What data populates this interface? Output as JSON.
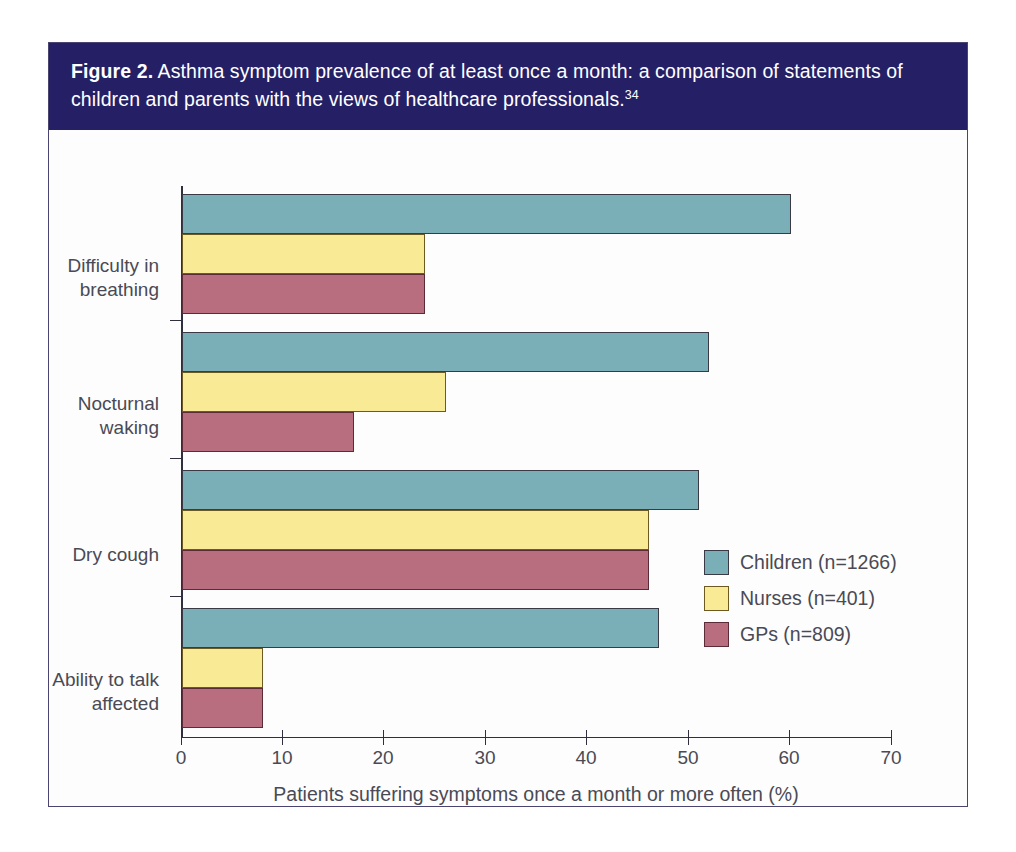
{
  "figure": {
    "label": "Figure 2.",
    "caption": " Asthma symptom prevalence of at least once a month: a comparison of statements of children and parents with the views of healthcare professionals.",
    "reference": "34",
    "header_color": "#251f66",
    "frame_color": "#4a4470"
  },
  "chart_data": {
    "type": "bar",
    "orientation": "horizontal",
    "title": "Asthma symptom prevalence of at least once a month: a comparison of statements of children and parents with the views of healthcare professionals.",
    "xlabel": "Patients suffering symptoms once a month or more often (%)",
    "ylabel": "",
    "categories": [
      "Difficulty in breathing",
      "Nocturnal waking",
      "Dry cough",
      "Ability to talk affected"
    ],
    "series": [
      {
        "name": "Children (n=1266)",
        "color": "#7bafb8",
        "values": [
          60,
          52,
          51,
          47
        ]
      },
      {
        "name": "Nurses (n=401)",
        "color": "#f9eb95",
        "values": [
          24,
          26,
          46,
          8
        ]
      },
      {
        "name": "GPs (n=809)",
        "color": "#b96e80",
        "values": [
          24,
          17,
          46,
          8
        ]
      }
    ],
    "xlim": [
      0,
      70
    ],
    "xticks": [
      0,
      10,
      20,
      30,
      40,
      50,
      60,
      70
    ],
    "xtick_labels": [
      "0",
      "10",
      "20",
      "30",
      "40",
      "50",
      "60",
      "70"
    ],
    "grid": false,
    "legend_position": "inside-right-lower"
  }
}
